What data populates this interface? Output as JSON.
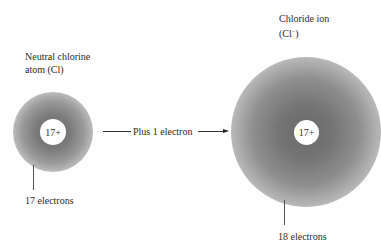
{
  "atom": {
    "title_line1": "Neutral chlorine",
    "title_line2": "atom (Cl)",
    "nucleus_charge": "17+",
    "electrons_label": "17 electrons"
  },
  "transition": {
    "label": "Plus 1 electron"
  },
  "ion": {
    "title_line1": "Chloride ion",
    "title_line2_prefix": "(Cl",
    "title_line2_sup": "−",
    "title_line2_suffix": ")",
    "nucleus_charge": "17+",
    "electrons_label": "18 electrons"
  },
  "colors": {
    "cloud_core": "#6a6a6a",
    "background": "#ffffff"
  }
}
